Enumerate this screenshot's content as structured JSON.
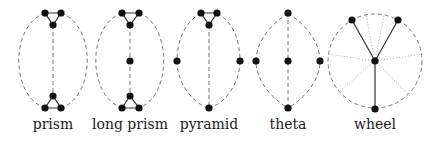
{
  "colors": {
    "vertex": "#111111",
    "solid_edge": "#333333",
    "dashed_edge": "#777777",
    "dotted_edge": "#aaaaaa"
  },
  "graphs": [
    {
      "name": "prism",
      "label": "prism",
      "label_x": 53
    },
    {
      "name": "long-prism",
      "label": "long prism",
      "label_x": 130
    },
    {
      "name": "pyramid",
      "label": "pyramid",
      "label_x": 209
    },
    {
      "name": "theta",
      "label": "theta",
      "label_x": 288
    },
    {
      "name": "wheel",
      "label": "wheel",
      "label_x": 375
    }
  ]
}
